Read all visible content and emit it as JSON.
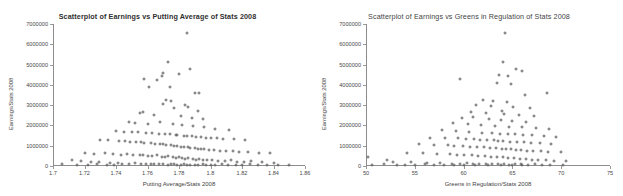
{
  "page": {
    "background": "#ffffff",
    "marker_color": "#636363",
    "axis_color": "#8d8d8d"
  },
  "charts": [
    {
      "id": "left",
      "title": "Scatterplot of Earnings vs Putting Average of Stats 2008",
      "xlabel": "Putting Average/Stats 2008",
      "ylabel": "Earnings/Stats 2008",
      "xticks": [
        "1.7",
        "1.72",
        "1.74",
        "1.76",
        "1.78",
        "1.8",
        "1.82",
        "1.84",
        "1.86"
      ],
      "yticks": [
        "0",
        "1000000",
        "2000000",
        "3000000",
        "4000000",
        "5000000",
        "6000000",
        "7000000"
      ]
    },
    {
      "id": "right",
      "title": "Scatterplot of Earnings vs Greens in Regulation of Stats 2008",
      "xlabel": "Greens in Regulation/Stats 2008",
      "ylabel": "Earnings/Stats 2008",
      "xticks": [
        "50",
        "55",
        "60",
        "65",
        "70",
        "75"
      ],
      "yticks": [
        "0",
        "1000000",
        "2000000",
        "3000000",
        "4000000",
        "5000000",
        "6000000",
        "7000000"
      ]
    }
  ],
  "chart_data": [
    {
      "type": "scatter",
      "title": "Scatterplot of Earnings vs Putting Average of Stats 2008",
      "xlabel": "Putting Average/Stats 2008",
      "ylabel": "Earnings/Stats 2008",
      "xlim": [
        1.7,
        1.86
      ],
      "ylim": [
        0,
        7000000
      ],
      "xtick_step": 0.02,
      "ytick_step": 1000000,
      "grid": false,
      "legend": "none",
      "marker": "plus",
      "points": [
        [
          1.785,
          6550000
        ],
        [
          1.773,
          5150000
        ],
        [
          1.787,
          4800000
        ],
        [
          1.77,
          4600000
        ],
        [
          1.769,
          4430000
        ],
        [
          1.78,
          4530000
        ],
        [
          1.758,
          4280000
        ],
        [
          1.766,
          4250000
        ],
        [
          1.79,
          3600000
        ],
        [
          1.793,
          3620000
        ],
        [
          1.761,
          3870000
        ],
        [
          1.774,
          3880000
        ],
        [
          1.772,
          3250000
        ],
        [
          1.775,
          3200000
        ],
        [
          1.77,
          3050000
        ],
        [
          1.784,
          3020000
        ],
        [
          1.777,
          2860000
        ],
        [
          1.786,
          2900000
        ],
        [
          1.792,
          2700000
        ],
        [
          1.755,
          2620000
        ],
        [
          1.757,
          2640000
        ],
        [
          1.764,
          2500000
        ],
        [
          1.781,
          2480000
        ],
        [
          1.788,
          2380000
        ],
        [
          1.795,
          2300000
        ],
        [
          1.748,
          2150000
        ],
        [
          1.752,
          2120000
        ],
        [
          1.76,
          2080000
        ],
        [
          1.768,
          2180000
        ],
        [
          1.776,
          2060000
        ],
        [
          1.782,
          2020000
        ],
        [
          1.789,
          1960000
        ],
        [
          1.796,
          1900000
        ],
        [
          1.803,
          1840000
        ],
        [
          1.812,
          1780000
        ],
        [
          1.74,
          1720000
        ],
        [
          1.745,
          1700000
        ],
        [
          1.75,
          1680000
        ],
        [
          1.754,
          1660000
        ],
        [
          1.759,
          1640000
        ],
        [
          1.763,
          1620000
        ],
        [
          1.767,
          1600000
        ],
        [
          1.771,
          1580000
        ],
        [
          1.774,
          1560000
        ],
        [
          1.778,
          1540000
        ],
        [
          1.779,
          1520000
        ],
        [
          1.783,
          1500000
        ],
        [
          1.785,
          1480000
        ],
        [
          1.788,
          1460000
        ],
        [
          1.791,
          1440000
        ],
        [
          1.794,
          1420000
        ],
        [
          1.797,
          1400000
        ],
        [
          1.8,
          1380000
        ],
        [
          1.804,
          1360000
        ],
        [
          1.808,
          1340000
        ],
        [
          1.815,
          1320000
        ],
        [
          1.822,
          1300000
        ],
        [
          1.73,
          1280000
        ],
        [
          1.735,
          1260000
        ],
        [
          1.742,
          1240000
        ],
        [
          1.746,
          1220000
        ],
        [
          1.749,
          1200000
        ],
        [
          1.753,
          1180000
        ],
        [
          1.756,
          1160000
        ],
        [
          1.758,
          1140000
        ],
        [
          1.762,
          1120000
        ],
        [
          1.765,
          1100000
        ],
        [
          1.768,
          1080000
        ],
        [
          1.77,
          1060000
        ],
        [
          1.772,
          1040000
        ],
        [
          1.775,
          1020000
        ],
        [
          1.777,
          1000000
        ],
        [
          1.779,
          980000
        ],
        [
          1.781,
          960000
        ],
        [
          1.783,
          940000
        ],
        [
          1.786,
          920000
        ],
        [
          1.787,
          900000
        ],
        [
          1.79,
          880000
        ],
        [
          1.792,
          860000
        ],
        [
          1.794,
          840000
        ],
        [
          1.796,
          820000
        ],
        [
          1.799,
          800000
        ],
        [
          1.802,
          780000
        ],
        [
          1.806,
          760000
        ],
        [
          1.81,
          740000
        ],
        [
          1.814,
          720000
        ],
        [
          1.818,
          700000
        ],
        [
          1.824,
          680000
        ],
        [
          1.831,
          660000
        ],
        [
          1.838,
          640000
        ],
        [
          1.72,
          620000
        ],
        [
          1.726,
          600000
        ],
        [
          1.733,
          640000
        ],
        [
          1.738,
          580000
        ],
        [
          1.743,
          560000
        ],
        [
          1.747,
          600000
        ],
        [
          1.751,
          540000
        ],
        [
          1.755,
          520000
        ],
        [
          1.757,
          560000
        ],
        [
          1.76,
          500000
        ],
        [
          1.763,
          480000
        ],
        [
          1.766,
          520000
        ],
        [
          1.769,
          460000
        ],
        [
          1.771,
          440000
        ],
        [
          1.773,
          480000
        ],
        [
          1.776,
          420000
        ],
        [
          1.778,
          400000
        ],
        [
          1.78,
          440000
        ],
        [
          1.782,
          380000
        ],
        [
          1.784,
          360000
        ],
        [
          1.786,
          400000
        ],
        [
          1.789,
          340000
        ],
        [
          1.791,
          320000
        ],
        [
          1.793,
          360000
        ],
        [
          1.795,
          300000
        ],
        [
          1.798,
          280000
        ],
        [
          1.801,
          320000
        ],
        [
          1.805,
          260000
        ],
        [
          1.809,
          240000
        ],
        [
          1.813,
          280000
        ],
        [
          1.817,
          220000
        ],
        [
          1.821,
          200000
        ],
        [
          1.826,
          240000
        ],
        [
          1.833,
          180000
        ],
        [
          1.84,
          160000
        ],
        [
          1.712,
          300000
        ],
        [
          1.718,
          260000
        ],
        [
          1.724,
          200000
        ],
        [
          1.729,
          180000
        ],
        [
          1.736,
          160000
        ],
        [
          1.741,
          140000
        ],
        [
          1.744,
          120000
        ],
        [
          1.748,
          100000
        ],
        [
          1.752,
          140000
        ],
        [
          1.756,
          120000
        ],
        [
          1.759,
          100000
        ],
        [
          1.762,
          80000
        ],
        [
          1.764,
          120000
        ],
        [
          1.767,
          100000
        ],
        [
          1.77,
          80000
        ],
        [
          1.773,
          60000
        ],
        [
          1.775,
          100000
        ],
        [
          1.777,
          80000
        ],
        [
          1.779,
          60000
        ],
        [
          1.781,
          40000
        ],
        [
          1.783,
          80000
        ],
        [
          1.785,
          60000
        ],
        [
          1.787,
          40000
        ],
        [
          1.79,
          60000
        ],
        [
          1.792,
          40000
        ],
        [
          1.795,
          80000
        ],
        [
          1.797,
          40000
        ],
        [
          1.8,
          60000
        ],
        [
          1.803,
          40000
        ],
        [
          1.807,
          80000
        ],
        [
          1.811,
          40000
        ],
        [
          1.816,
          60000
        ],
        [
          1.82,
          40000
        ],
        [
          1.825,
          80000
        ],
        [
          1.83,
          40000
        ],
        [
          1.836,
          60000
        ],
        [
          1.843,
          40000
        ],
        [
          1.85,
          60000
        ],
        [
          1.706,
          120000
        ],
        [
          1.715,
          60000
        ],
        [
          1.722,
          40000
        ],
        [
          1.728,
          80000
        ],
        [
          1.734,
          40000
        ],
        [
          1.739,
          60000
        ]
      ]
    },
    {
      "type": "scatter",
      "title": "Scatterplot of Earnings vs Greens in Regulation of Stats 2008",
      "xlabel": "Greens in Regulation/Stats 2008",
      "ylabel": "Earnings/Stats 2008",
      "xlim": [
        50,
        75
      ],
      "ylim": [
        0,
        7000000
      ],
      "xtick_step": 5,
      "ytick_step": 1000000,
      "grid": false,
      "legend": "none",
      "marker": "plus",
      "points": [
        [
          64.2,
          6550000
        ],
        [
          64.0,
          5150000
        ],
        [
          65.4,
          4800000
        ],
        [
          66.0,
          4700000
        ],
        [
          63.6,
          4480000
        ],
        [
          64.6,
          4430000
        ],
        [
          63.4,
          4080000
        ],
        [
          64.9,
          4060000
        ],
        [
          59.6,
          4280000
        ],
        [
          68.5,
          3620000
        ],
        [
          66.3,
          3500000
        ],
        [
          62.0,
          3250000
        ],
        [
          63.0,
          3200000
        ],
        [
          64.4,
          3150000
        ],
        [
          61.3,
          3020000
        ],
        [
          62.8,
          2980000
        ],
        [
          65.1,
          2900000
        ],
        [
          66.8,
          2860000
        ],
        [
          63.9,
          2700000
        ],
        [
          60.8,
          2640000
        ],
        [
          62.3,
          2600000
        ],
        [
          64.1,
          2560000
        ],
        [
          65.7,
          2520000
        ],
        [
          67.2,
          2480000
        ],
        [
          61.0,
          2420000
        ],
        [
          59.8,
          2350000
        ],
        [
          62.6,
          2300000
        ],
        [
          63.8,
          2260000
        ],
        [
          65.0,
          2220000
        ],
        [
          66.4,
          2180000
        ],
        [
          58.9,
          2100000
        ],
        [
          60.4,
          2060000
        ],
        [
          61.8,
          2020000
        ],
        [
          63.2,
          1980000
        ],
        [
          64.7,
          1940000
        ],
        [
          66.0,
          1900000
        ],
        [
          67.4,
          1860000
        ],
        [
          68.8,
          1820000
        ],
        [
          57.8,
          1760000
        ],
        [
          59.2,
          1720000
        ],
        [
          60.6,
          1680000
        ],
        [
          61.9,
          1640000
        ],
        [
          62.9,
          1620000
        ],
        [
          63.7,
          1600000
        ],
        [
          64.5,
          1580000
        ],
        [
          65.3,
          1560000
        ],
        [
          66.1,
          1540000
        ],
        [
          67.0,
          1520000
        ],
        [
          68.2,
          1480000
        ],
        [
          69.5,
          1440000
        ],
        [
          56.6,
          1400000
        ],
        [
          58.1,
          1380000
        ],
        [
          59.4,
          1360000
        ],
        [
          60.2,
          1340000
        ],
        [
          61.1,
          1320000
        ],
        [
          61.7,
          1300000
        ],
        [
          62.4,
          1280000
        ],
        [
          63.1,
          1260000
        ],
        [
          63.5,
          1240000
        ],
        [
          64.0,
          1220000
        ],
        [
          64.8,
          1200000
        ],
        [
          65.5,
          1180000
        ],
        [
          66.2,
          1160000
        ],
        [
          66.9,
          1140000
        ],
        [
          67.8,
          1120000
        ],
        [
          69.0,
          1100000
        ],
        [
          55.4,
          1060000
        ],
        [
          57.0,
          1040000
        ],
        [
          58.4,
          1020000
        ],
        [
          59.0,
          1000000
        ],
        [
          59.9,
          980000
        ],
        [
          60.7,
          960000
        ],
        [
          61.4,
          940000
        ],
        [
          62.1,
          920000
        ],
        [
          62.7,
          900000
        ],
        [
          63.3,
          880000
        ],
        [
          63.9,
          860000
        ],
        [
          64.3,
          840000
        ],
        [
          64.9,
          820000
        ],
        [
          65.4,
          800000
        ],
        [
          65.9,
          780000
        ],
        [
          66.5,
          760000
        ],
        [
          67.1,
          740000
        ],
        [
          67.9,
          720000
        ],
        [
          68.6,
          700000
        ],
        [
          70.0,
          680000
        ],
        [
          54.2,
          640000
        ],
        [
          55.8,
          620000
        ],
        [
          57.3,
          600000
        ],
        [
          58.6,
          580000
        ],
        [
          59.3,
          560000
        ],
        [
          60.0,
          540000
        ],
        [
          60.9,
          520000
        ],
        [
          61.5,
          500000
        ],
        [
          62.2,
          480000
        ],
        [
          62.8,
          460000
        ],
        [
          63.4,
          440000
        ],
        [
          64.0,
          420000
        ],
        [
          64.6,
          400000
        ],
        [
          65.2,
          380000
        ],
        [
          65.8,
          360000
        ],
        [
          66.4,
          340000
        ],
        [
          67.0,
          320000
        ],
        [
          67.6,
          300000
        ],
        [
          68.4,
          280000
        ],
        [
          69.3,
          260000
        ],
        [
          70.5,
          240000
        ],
        [
          52.8,
          200000
        ],
        [
          54.6,
          180000
        ],
        [
          56.2,
          160000
        ],
        [
          57.6,
          140000
        ],
        [
          58.8,
          120000
        ],
        [
          59.6,
          100000
        ],
        [
          60.3,
          140000
        ],
        [
          61.0,
          120000
        ],
        [
          61.6,
          100000
        ],
        [
          62.3,
          80000
        ],
        [
          62.9,
          120000
        ],
        [
          63.5,
          100000
        ],
        [
          64.1,
          80000
        ],
        [
          64.7,
          60000
        ],
        [
          65.3,
          100000
        ],
        [
          65.9,
          80000
        ],
        [
          66.6,
          60000
        ],
        [
          67.3,
          80000
        ],
        [
          68.0,
          60000
        ],
        [
          68.9,
          40000
        ],
        [
          70.2,
          60000
        ],
        [
          50.6,
          60000
        ],
        [
          51.8,
          80000
        ],
        [
          53.2,
          40000
        ],
        [
          54.0,
          60000
        ],
        [
          55.0,
          40000
        ],
        [
          56.0,
          80000
        ],
        [
          57.0,
          40000
        ],
        [
          58.0,
          60000
        ],
        [
          59.0,
          40000
        ],
        [
          60.0,
          60000
        ],
        [
          61.2,
          40000
        ],
        [
          62.5,
          60000
        ],
        [
          63.8,
          40000
        ],
        [
          65.0,
          60000
        ],
        [
          66.0,
          40000
        ],
        [
          50.2,
          420000
        ],
        [
          52.2,
          300000
        ]
      ]
    }
  ]
}
